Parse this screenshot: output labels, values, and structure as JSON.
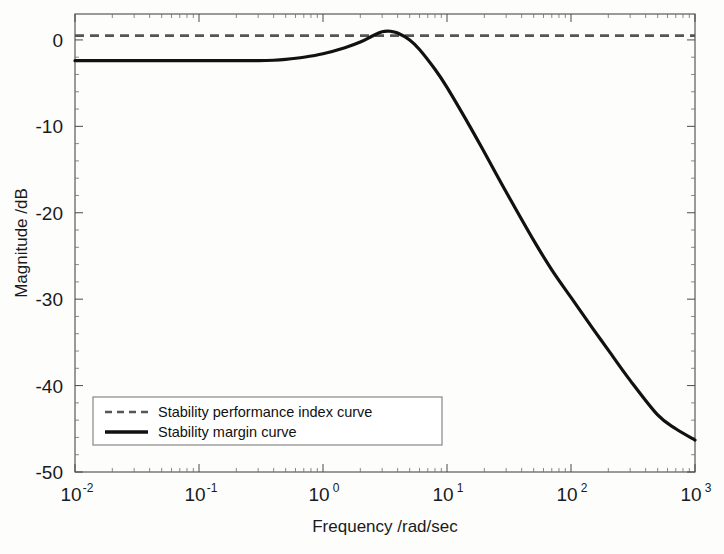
{
  "chart_data": {
    "type": "line",
    "title": "",
    "xlabel": "Frequency /rad/sec",
    "ylabel": "Magnitude /dB",
    "xscale": "log",
    "xlim": [
      0.01,
      1000
    ],
    "ylim": [
      -50,
      3
    ],
    "grid": false,
    "legend_position": "lower left",
    "xticks": [
      {
        "value": 0.01,
        "mantissa": "10",
        "exponent": "-2"
      },
      {
        "value": 0.1,
        "mantissa": "10",
        "exponent": "-1"
      },
      {
        "value": 1,
        "mantissa": "10",
        "exponent": "0"
      },
      {
        "value": 10,
        "mantissa": "10",
        "exponent": "1"
      },
      {
        "value": 100,
        "mantissa": "10",
        "exponent": "2"
      },
      {
        "value": 1000,
        "mantissa": "10",
        "exponent": "3"
      }
    ],
    "yticks": [
      0,
      -10,
      -20,
      -30,
      -40,
      -50
    ],
    "ytick_labels": [
      "0",
      "-10",
      "-20",
      "-30",
      "-40",
      "-50"
    ],
    "series": [
      {
        "name": "Stability performance index curve",
        "style": "dashed",
        "color": "#555555",
        "constant_value": 0.5,
        "x": [
          0.01,
          1000
        ],
        "values": [
          0.5,
          0.5
        ]
      },
      {
        "name": "Stability margin curve",
        "style": "solid",
        "color": "#111111",
        "x": [
          0.01,
          0.02,
          0.05,
          0.1,
          0.2,
          0.3,
          0.4,
          0.5,
          0.7,
          1.0,
          1.5,
          2.0,
          2.5,
          3.0,
          3.5,
          4.0,
          5.0,
          6.0,
          8.0,
          10.0,
          15.0,
          20.0,
          30.0,
          50.0,
          70.0,
          100.0,
          150.0,
          200.0,
          300.0,
          500.0,
          700.0,
          1000.0
        ],
        "values": [
          -2.4,
          -2.4,
          -2.4,
          -2.4,
          -2.4,
          -2.4,
          -2.35,
          -2.25,
          -2.0,
          -1.6,
          -0.9,
          -0.25,
          0.45,
          0.95,
          1.0,
          0.8,
          0.0,
          -1.1,
          -3.4,
          -5.5,
          -9.8,
          -13.0,
          -17.6,
          -23.2,
          -26.6,
          -29.8,
          -33.4,
          -35.9,
          -39.4,
          -43.4,
          -45.0,
          -46.3
        ]
      }
    ],
    "peak": {
      "frequency": 3.0,
      "magnitude": 1.0
    }
  },
  "legend": {
    "entries": [
      {
        "label": "Stability performance index curve",
        "style": "dashed"
      },
      {
        "label": "Stability margin curve",
        "style": "solid"
      }
    ]
  },
  "colors": {
    "solid_curve": "#111111",
    "dashed_curve": "#555555",
    "axis": "#4a4a4a",
    "background": "#fdfdfc"
  }
}
